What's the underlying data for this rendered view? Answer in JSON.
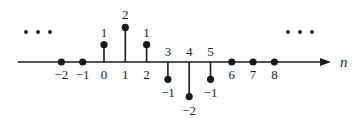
{
  "chart_data": {
    "type": "stem",
    "title": "",
    "xlabel": "n",
    "ylabel": "",
    "x": [
      -2,
      -1,
      0,
      1,
      2,
      3,
      4,
      5,
      6,
      7,
      8
    ],
    "values": [
      0,
      0,
      1,
      2,
      1,
      -1,
      -2,
      -1,
      0,
      0,
      0
    ],
    "tick_labels": [
      "−2",
      "−1",
      "0",
      "1",
      "2",
      "3",
      "4",
      "5",
      "6",
      "7",
      "8"
    ],
    "value_labels": [
      "",
      "",
      "1",
      "2",
      "1",
      "−1",
      "−2",
      "−1",
      "",
      "",
      ""
    ],
    "continuation_left": "• • •",
    "continuation_right": "• • •",
    "grid": false,
    "legend": null,
    "ylim": [
      -2,
      2
    ]
  },
  "style": {
    "ink": "#1a1a1a",
    "background": "#ffffff"
  }
}
